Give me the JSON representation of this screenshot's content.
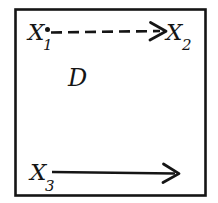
{
  "figure": {
    "kind": "hand-drawn-math-diagram",
    "region_label": "D",
    "ink_color": "#151515",
    "background_color": "#ffffff",
    "border": {
      "shape": "rectangle",
      "stroke_width": 2.5
    },
    "nodes": [
      {
        "id": "x1",
        "base": "X",
        "subscript": "1",
        "position": "top-left",
        "has_point_marker": true
      },
      {
        "id": "x2",
        "base": "X",
        "subscript": "2",
        "position": "top-right",
        "has_point_marker": false
      },
      {
        "id": "x3",
        "base": "X",
        "subscript": "3",
        "position": "bottom-left",
        "has_point_marker": false
      }
    ],
    "arrows": [
      {
        "id": "arrow-x1-x2",
        "style": "dashed",
        "from": "x1",
        "to": "x2",
        "direction": "right",
        "dash_count": 7,
        "arrowhead": "open-v"
      },
      {
        "id": "arrow-x3",
        "style": "solid",
        "from": "x3",
        "to": "",
        "direction": "right",
        "dash_count": 0,
        "arrowhead": "open-v"
      }
    ]
  }
}
